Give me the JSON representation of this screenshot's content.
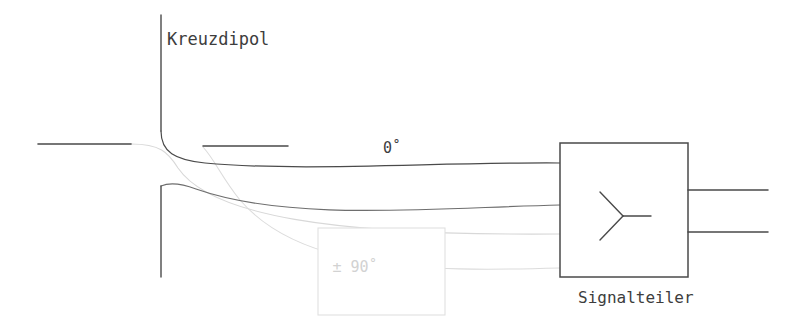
{
  "diagram": {
    "type": "antenna-feed-network-schematic",
    "background_color": "#ffffff",
    "labels": {
      "antenna": "Kreuzdipol",
      "phase_zero": "0˚",
      "phase_quadrature": "± 90˚",
      "splitter": "Signalteiler"
    },
    "colors": {
      "line_dark": "#4a4a4a",
      "line_mid": "#6e6e6e",
      "line_light": "#d8d8d8",
      "line_light2": "#dcdcdc",
      "text_dark": "#3d3d3d",
      "text_light": "#d2d2d2",
      "box_stroke": "#4a4a4a",
      "box_light_stroke": "#e0e0e0",
      "box_fill": "#ffffff"
    },
    "elements": {
      "antenna_vertical_upper": {
        "name": "dipole-arm-vertical-upper",
        "x": 161,
        "y1": 15,
        "y2": 131
      },
      "antenna_vertical_lower": {
        "name": "dipole-arm-vertical-lower",
        "x": 161,
        "y1": 186,
        "y2": 277
      },
      "antenna_horizontal_left": {
        "name": "dipole-arm-horizontal-left",
        "y": 144,
        "x1": 38,
        "x2": 131
      },
      "antenna_horizontal_stub": {
        "name": "dipole-arm-horizontal-stub",
        "y": 146,
        "x1": 203,
        "x2": 288
      },
      "splitter_box": {
        "name": "signalteiler-box",
        "x": 560,
        "y": 143,
        "width": 128,
        "height": 134
      },
      "phase_box": {
        "name": "phase-shifter-box",
        "x": 318,
        "y": 228,
        "width": 127,
        "height": 87
      },
      "output_line_top": {
        "name": "splitter-output-top",
        "y": 190,
        "x1": 688,
        "x2": 768
      },
      "output_line_bottom": {
        "name": "splitter-output-bottom",
        "y": 232,
        "x1": 688,
        "x2": 768
      }
    },
    "feed_paths": {
      "dark_upper": "M161,131 C161,152 175,160 205,163 C300,172 440,162 560,163",
      "dark_lower": "M161,186 C168,183 180,183 196,189 C290,222 430,208 560,205",
      "light_upper": "M131,144 C160,144 168,152 178,168 C210,215 330,236 560,234",
      "light_lower": "M203,147 C215,160 222,178 240,200 C300,270 420,272 560,268"
    }
  }
}
